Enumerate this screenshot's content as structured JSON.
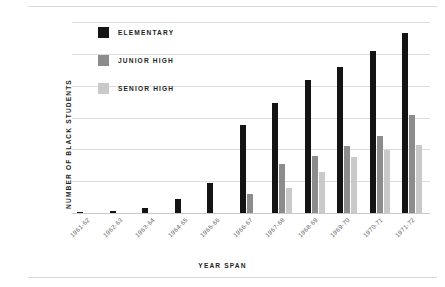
{
  "chart_data": {
    "type": "bar",
    "title": "",
    "xlabel": "YEAR SPAN",
    "ylabel": "NUMBER OF BLACK STUDENTS",
    "ylim": [
      0,
      12000
    ],
    "yticks": [
      0,
      2000,
      4000,
      6000,
      8000,
      10000,
      12000
    ],
    "ytick_labels": [
      "0",
      "2,000",
      "4,000",
      "6,000",
      "8,000",
      "10,000",
      "12,000"
    ],
    "grid": true,
    "legend_position": "upper-left-inside",
    "categories": [
      "1961-62",
      "1962-63",
      "1963-64",
      "1964-65",
      "1965-66",
      "1966-67",
      "1967-68",
      "1968-69",
      "1969-70",
      "1970-71",
      "1971-72"
    ],
    "series": [
      {
        "name": "ELEMENTARY",
        "color": "#141414",
        "values": [
          30,
          110,
          320,
          870,
          1900,
          5500,
          6900,
          8350,
          9150,
          10200,
          11300
        ]
      },
      {
        "name": "JUNIOR HIGH",
        "color": "#8c8c8c",
        "values": [
          0,
          0,
          0,
          0,
          0,
          1200,
          3100,
          3600,
          4200,
          4850,
          6150
        ]
      },
      {
        "name": "SENIOR HIGH",
        "color": "#c9c9c9",
        "values": [
          0,
          0,
          0,
          0,
          0,
          0,
          1600,
          2600,
          3500,
          3950,
          4250
        ]
      }
    ]
  },
  "legend": {
    "items": [
      {
        "label": "ELEMENTARY",
        "color": "#141414"
      },
      {
        "label": "JUNIOR HIGH",
        "color": "#8c8c8c"
      },
      {
        "label": "SENIOR HIGH",
        "color": "#c9c9c9"
      }
    ]
  }
}
